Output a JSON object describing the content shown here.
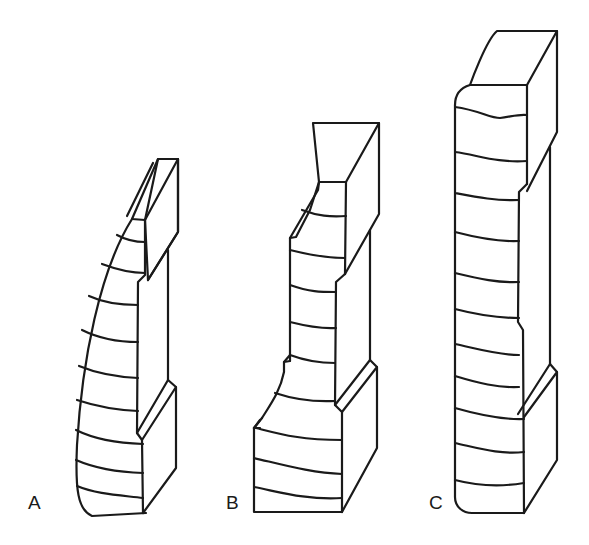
{
  "figure": {
    "type": "line-drawing",
    "stroke_color": "#1a1a1a",
    "background": "#ffffff"
  },
  "specimens": [
    {
      "id": "A",
      "label": "A",
      "description": "curved tapering front with stepped back block"
    },
    {
      "id": "B",
      "label": "B",
      "description": "stepped notched front with stepped back block"
    },
    {
      "id": "C",
      "label": "C",
      "description": "full-height rectangular front with stepped back block"
    }
  ]
}
